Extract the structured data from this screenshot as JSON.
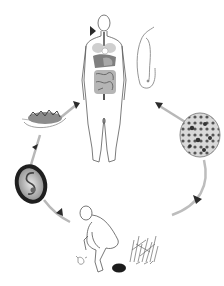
{
  "diagram": {
    "type": "life-cycle",
    "background": "#ffffff",
    "stroke_color": "#555555",
    "arrow_color": "#b5b5b5",
    "arrowhead_color": "#2a2a2a",
    "flow_direction": "clockwise",
    "stages": [
      {
        "id": "host",
        "description": "Human host with digestive organs shown",
        "position": "top-center"
      },
      {
        "id": "adult-worm",
        "description": "Adult worm",
        "position": "top-right"
      },
      {
        "id": "egg-mass",
        "description": "Egg mass",
        "position": "right"
      },
      {
        "id": "defecation",
        "description": "Squatting person defecating near vegetation",
        "position": "bottom-center"
      },
      {
        "id": "embryonated-egg",
        "description": "Embryonated egg with larva",
        "position": "left"
      },
      {
        "id": "contaminated-food",
        "description": "Contaminated food on a plate / leaf",
        "position": "upper-left"
      }
    ],
    "connections": [
      {
        "from": "host",
        "to": "egg-mass"
      },
      {
        "from": "egg-mass",
        "to": "defecation"
      },
      {
        "from": "defecation",
        "to": "embryonated-egg"
      },
      {
        "from": "embryonated-egg",
        "to": "contaminated-food"
      },
      {
        "from": "contaminated-food",
        "to": "host"
      }
    ],
    "caption": ""
  }
}
